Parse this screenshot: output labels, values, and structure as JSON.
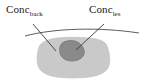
{
  "figure": {
    "name": "lesion-in-background-tissue-diagram",
    "width": 144,
    "height": 84,
    "background_color": "#ffffff"
  },
  "labels": {
    "background": {
      "base": "Conc",
      "subscript": "back",
      "full": "Conc_back",
      "meaning": "background-concentration",
      "color": "#1a1a1a"
    },
    "lesion": {
      "base": "Conc",
      "subscript": "les",
      "full": "Conc_les",
      "meaning": "lesion-concentration",
      "color": "#1a1a1a"
    }
  },
  "shapes": {
    "background_region": {
      "name": "background-tissue-blob",
      "fill": "#c9c9c9",
      "stroke": "#b9b9b9"
    },
    "lesion_region": {
      "name": "lesion-blob",
      "fill": "#8a8a8a",
      "stroke": "#6f6f6f"
    },
    "surface_curve": {
      "name": "tissue-surface-curve",
      "stroke": "#4a4a4a"
    },
    "leader_lines": {
      "name": "leader-line",
      "stroke": "#3a3a3a",
      "count": 2
    }
  }
}
